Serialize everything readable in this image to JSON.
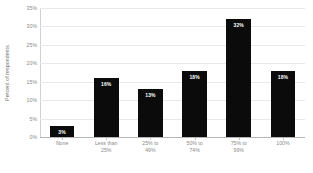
{
  "chart_data": {
    "type": "bar",
    "title": "",
    "subtitle": "",
    "xlabel": "",
    "ylabel": "Percent of respondents",
    "categories": [
      "None",
      "Less than 25%",
      "25% to 49%",
      "50% to 74%",
      "75% to 99%",
      "100%"
    ],
    "category_lines": [
      [
        "None"
      ],
      [
        "Less than",
        "25%"
      ],
      [
        "25% to",
        "49%"
      ],
      [
        "50% to",
        "74%"
      ],
      [
        "75% to",
        "99%"
      ],
      [
        "100%"
      ]
    ],
    "values": [
      3,
      16,
      13,
      18,
      32,
      18
    ],
    "data_labels": [
      "3%",
      "16%",
      "13%",
      "18%",
      "32%",
      "18%"
    ],
    "ylim": [
      0,
      35
    ],
    "ytick_values": [
      35,
      30,
      25,
      20,
      15,
      10,
      5,
      0
    ],
    "ytick_labels": [
      "35%",
      "30%",
      "25%",
      "20%",
      "15%",
      "10%",
      "5%",
      "0%"
    ],
    "grid": true,
    "legend": false,
    "legend_position": "none",
    "bar_color": "#0b0b0b",
    "data_label_color": "#FFFFFF",
    "gridline_color": "#E9E9E9",
    "axis_text_color": "#8A8A8A",
    "background_color": "#FFFFFF"
  }
}
